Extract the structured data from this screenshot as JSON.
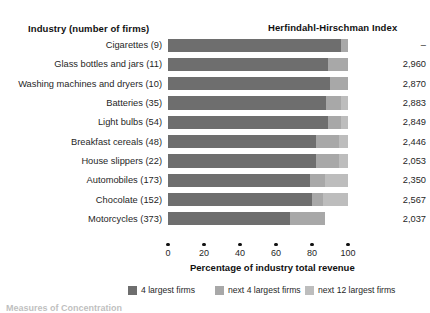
{
  "headers": {
    "industry": "Industry (number of firms)",
    "hhi": "Herfindahl-Hirschman Index"
  },
  "axis": {
    "title": "Percentage of industry total revenue",
    "ticks": [
      "0",
      "20",
      "40",
      "60",
      "80",
      "100"
    ]
  },
  "legend": [
    {
      "label": "4 largest firms",
      "color": "#6e6e6e"
    },
    {
      "label": "next 4 largest firms",
      "color": "#a8a8a8"
    },
    {
      "label": "next 12 largest firms",
      "color": "#bdbdbd"
    }
  ],
  "footnote": "Measures of Concentration",
  "rows": [
    {
      "label": "Cigarettes  (9)",
      "hhi": "–",
      "s1": 96,
      "s2": 4,
      "s3": 0
    },
    {
      "label": "Glass bottles and jars  (11)",
      "hhi": "2,960",
      "s1": 89,
      "s2": 11,
      "s3": 0
    },
    {
      "label": "Washing machines and dryers  (10)",
      "hhi": "2,870",
      "s1": 90,
      "s2": 10,
      "s3": 0
    },
    {
      "label": "Batteries  (35)",
      "hhi": "2,883",
      "s1": 88,
      "s2": 8,
      "s3": 4
    },
    {
      "label": "Light bulbs  (54)",
      "hhi": "2,849",
      "s1": 89,
      "s2": 7,
      "s3": 4
    },
    {
      "label": "Breakfast cereals  (48)",
      "hhi": "2,446",
      "s1": 82,
      "s2": 13,
      "s3": 5
    },
    {
      "label": "House slippers  (22)",
      "hhi": "2,053",
      "s1": 82,
      "s2": 13,
      "s3": 5
    },
    {
      "label": "Automobiles  (173)",
      "hhi": "2,350",
      "s1": 79,
      "s2": 8,
      "s3": 13
    },
    {
      "label": "Chocolate  (152)",
      "hhi": "2,567",
      "s1": 80,
      "s2": 6,
      "s3": 14
    },
    {
      "label": "Motorcycles  (373)",
      "hhi": "2,037",
      "s1": 68,
      "s2": 19,
      "s3": 0
    }
  ],
  "chart_data": {
    "type": "bar",
    "title": "Measures of Concentration",
    "xlabel": "Percentage of industry total revenue",
    "ylabel": "Industry (number of firms)",
    "xlim": [
      0,
      100
    ],
    "grid": false,
    "legend_position": "bottom",
    "stacked": true,
    "categories": [
      "Cigarettes  (9)",
      "Glass bottles and jars  (11)",
      "Washing machines and dryers  (10)",
      "Batteries  (35)",
      "Light bulbs  (54)",
      "Breakfast cereals  (48)",
      "House slippers  (22)",
      "Automobiles  (173)",
      "Chocolate  (152)",
      "Motorcycles  (373)"
    ],
    "series": [
      {
        "name": "4 largest firms",
        "values": [
          96,
          89,
          90,
          88,
          89,
          82,
          82,
          79,
          80,
          68
        ]
      },
      {
        "name": "next 4 largest firms",
        "values": [
          4,
          11,
          10,
          8,
          7,
          13,
          13,
          8,
          6,
          19
        ]
      },
      {
        "name": "next 12 largest firms",
        "values": [
          0,
          0,
          0,
          4,
          4,
          5,
          5,
          13,
          14,
          0
        ]
      }
    ],
    "annotations": {
      "Herfindahl-Hirschman Index": [
        "–",
        "2,960",
        "2,870",
        "2,883",
        "2,849",
        "2,446",
        "2,053",
        "2,350",
        "2,567",
        "2,037"
      ]
    }
  }
}
